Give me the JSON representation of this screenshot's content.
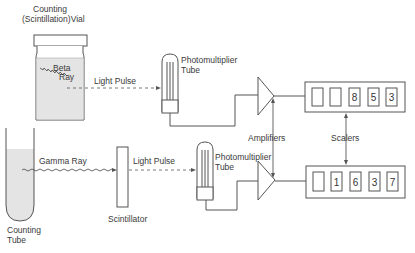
{
  "diagram": {
    "title": "",
    "labels": {
      "vial_line1": "Counting",
      "vial_line2": "(Scintillation)Vial",
      "beta_line1": "Beta",
      "beta_line2": "Ray",
      "light_pulse_top": "Light Pulse",
      "pmt_top_line1": "Photomultiplier",
      "pmt_top_line2": "Tube",
      "gamma_ray": "Gamma Ray",
      "light_pulse_bottom": "Light Pulse",
      "pmt_bottom_line1": "Photomultiplier",
      "pmt_bottom_line2": "Tube",
      "scintillator": "Scintillator",
      "tube_line1": "Counting",
      "tube_line2": "Tube",
      "amplifiers": "Amplifiers",
      "scalers": "Scalers"
    },
    "scaler_top_digits": [
      "",
      "",
      "8",
      "5",
      "3"
    ],
    "scaler_bottom_digits": [
      "",
      "1",
      "6",
      "3",
      "7"
    ],
    "colors": {
      "line": "#555555",
      "liquid": "#e4e4e4",
      "text": "#3a3a3a"
    }
  }
}
